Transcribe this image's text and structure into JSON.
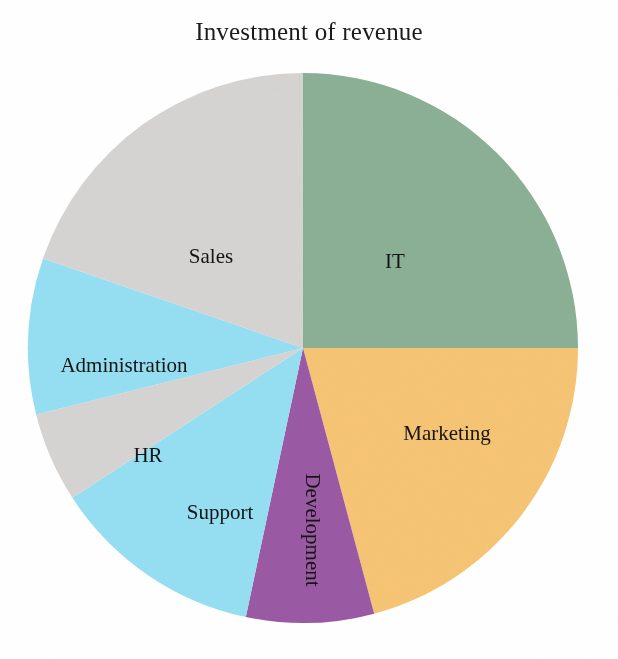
{
  "chart_data": {
    "type": "pie",
    "title": "Investment of revenue",
    "xlabel": "",
    "ylabel": "",
    "legend_position": "none",
    "grid": false,
    "labels_inside_slices": true,
    "start_angle_deg": 0,
    "direction": "clockwise",
    "categories": [
      "IT",
      "Marketing",
      "Development",
      "Support",
      "HR",
      "Administration",
      "Sales"
    ],
    "values": [
      25,
      21,
      7.5,
      12.5,
      5,
      9,
      20
    ],
    "units": "percent",
    "slices": [
      {
        "label": "IT",
        "value": 25,
        "color": "#8BB096",
        "start_angle_deg": 0,
        "end_angle_deg": 90,
        "label_x": 395,
        "label_y": 261,
        "label_rotated": false
      },
      {
        "label": "Marketing",
        "value": 21,
        "color": "#F6C474",
        "start_angle_deg": 90,
        "end_angle_deg": 165,
        "label_x": 447,
        "label_y": 433,
        "label_rotated": false
      },
      {
        "label": "Development",
        "value": 7.5,
        "color": "#9B59A4",
        "start_angle_deg": 165,
        "end_angle_deg": 192,
        "label_x": 312,
        "label_y": 530,
        "label_rotated": true
      },
      {
        "label": "Support",
        "value": 12.5,
        "color": "#96DEF2",
        "start_angle_deg": 192,
        "end_angle_deg": 237,
        "label_x": 220,
        "label_y": 512,
        "label_rotated": false
      },
      {
        "label": "HR",
        "value": 5,
        "color": "#D6D4D2",
        "start_angle_deg": 237,
        "end_angle_deg": 256,
        "label_x": 148,
        "label_y": 455,
        "label_rotated": false
      },
      {
        "label": "Administration",
        "value": 9,
        "color": "#96DEF2",
        "start_angle_deg": 256,
        "end_angle_deg": 289,
        "label_x": 124,
        "label_y": 365,
        "label_rotated": false
      },
      {
        "label": "Sales",
        "value": 20,
        "color": "#D6D4D2",
        "start_angle_deg": 289,
        "end_angle_deg": 360,
        "label_x": 211,
        "label_y": 256,
        "label_rotated": false
      }
    ],
    "geometry": {
      "center_x": 303,
      "center_y": 348,
      "radius": 275
    },
    "colors": {
      "it_green": "#8BB096",
      "marketing_orange": "#F6C474",
      "development_purple": "#9B59A4",
      "support_blue": "#96DEF2",
      "hr_gray": "#D6D4D2",
      "administration_blue": "#96DEF2",
      "sales_gray": "#D6D4D2",
      "background": "#FFFFFF",
      "text": "#151515"
    }
  }
}
